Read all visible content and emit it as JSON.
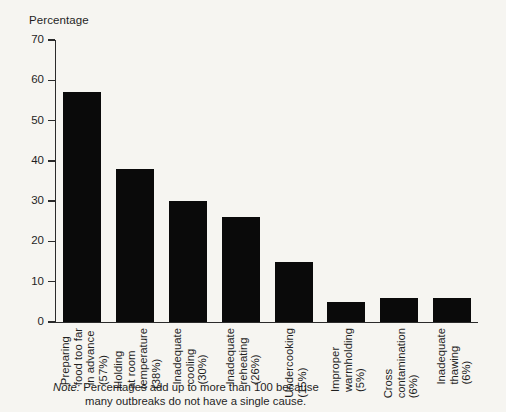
{
  "chart_data": {
    "type": "bar",
    "title": "",
    "ylabel": "Percentage",
    "xlabel": "",
    "ylim": [
      0,
      70
    ],
    "yticks": [
      0,
      10,
      20,
      30,
      40,
      50,
      60,
      70
    ],
    "grid": false,
    "legend": null,
    "bar_color": "#0a0a0a",
    "categories": [
      "Preparing food too far in advance (57%)",
      "Holding at room temperature (38%)",
      "Inadequate cooling (30%)",
      "Inadequate reheating (26%)",
      "Undercooking (15%)",
      "Improper warmholding (5%)",
      "Cross contamination (6%)",
      "Inadequate thawing (6%)"
    ],
    "category_lines": [
      [
        "Preparing",
        "food too far",
        "in advance",
        "(57%)"
      ],
      [
        "Holding",
        "at room",
        "temperature",
        "(38%)"
      ],
      [
        "Inadequate",
        "cooling",
        "(30%)"
      ],
      [
        "Inadequate",
        "reheating",
        "(26%)"
      ],
      [
        "Undercooking",
        "(15%)"
      ],
      [
        "Improper",
        "warmholding",
        "(5%)"
      ],
      [
        "Cross",
        "contamination",
        "(6%)"
      ],
      [
        "Inadequate",
        "thawing",
        "(6%)"
      ]
    ],
    "values": [
      57,
      38,
      30,
      26,
      15,
      5,
      6,
      6
    ],
    "annotations": {
      "note_label": "Note:",
      "note_line1": "Percentages add up to more than 100 because",
      "note_line2": "many outbreaks do not have a single cause."
    }
  }
}
